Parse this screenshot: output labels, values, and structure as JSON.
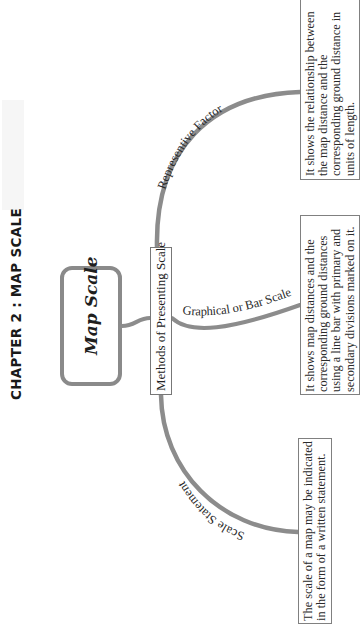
{
  "title": "CHAPTER 2 : MAP SCALE",
  "diagram": {
    "orientation": "rotated 90° counter-clockwise",
    "root": {
      "label": "Map Scale"
    },
    "hub": {
      "label": "Methods of Presenting Scale"
    },
    "branches": [
      {
        "label": "Representive Factor",
        "description": "It shows the relationship between the map distance and the corresponding ground distance in units of length."
      },
      {
        "label": "Graphical or Bar Scale",
        "description": "It shows map distances and the corresponding ground distances using a line bar with primary and secondary divisions marked on it."
      },
      {
        "label": "Scale Statement",
        "description": "The scale of a map may be indicated in the form of a written statement."
      }
    ],
    "colors": {
      "branch_stroke": "#8c8c8c",
      "box_border": "#808080",
      "text": "#222222",
      "background": "#ffffff"
    }
  }
}
